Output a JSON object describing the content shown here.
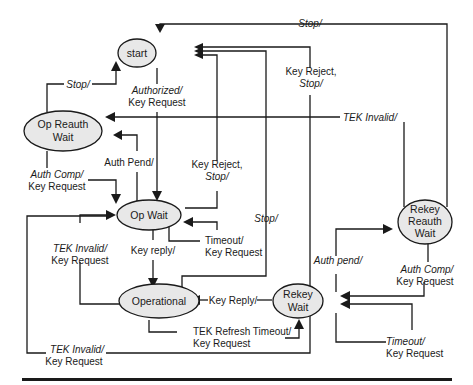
{
  "diagram": {
    "type": "state-machine",
    "states": [
      {
        "id": "start",
        "label": [
          "start"
        ]
      },
      {
        "id": "op_reauth_wait",
        "label": [
          "Op Reauth",
          "Wait"
        ]
      },
      {
        "id": "op_wait",
        "label": [
          "Op Wait"
        ]
      },
      {
        "id": "operational",
        "label": [
          "Operational"
        ]
      },
      {
        "id": "rekey_wait",
        "label": [
          "Rekey",
          "Wait"
        ]
      },
      {
        "id": "rekey_reauth_wait",
        "label": [
          "Rekey",
          "Reauth",
          "Wait"
        ]
      }
    ],
    "transitions": [
      {
        "from": "op_reauth_wait",
        "to": "start",
        "event": "Stop/",
        "action": ""
      },
      {
        "from": "start",
        "to": "op_wait",
        "event": "Authorized/",
        "action": "Key Request"
      },
      {
        "from": "op_wait",
        "to": "op_reauth_wait",
        "event": "Auth Pend/",
        "action": ""
      },
      {
        "from": "op_reauth_wait",
        "to": "op_wait",
        "event": "Auth Comp/",
        "action": "Key Request"
      },
      {
        "from": "op_wait",
        "to": "start",
        "event": "Key Reject, Stop/",
        "action": ""
      },
      {
        "from": "op_wait",
        "to": "op_wait",
        "event": "Timeout/",
        "action": "Key Request"
      },
      {
        "from": "op_wait",
        "to": "operational",
        "event": "Key reply/",
        "action": ""
      },
      {
        "from": "operational",
        "to": "op_wait",
        "event": "TEK Invalid/",
        "action": "Key Request"
      },
      {
        "from": "operational",
        "to": "start",
        "event": "Stop/",
        "action": ""
      },
      {
        "from": "operational",
        "to": "rekey_wait",
        "event": "TEK Refresh Timeout/",
        "action": "Key Request"
      },
      {
        "from": "rekey_wait",
        "to": "operational",
        "event": "Key Reply/",
        "action": ""
      },
      {
        "from": "rekey_wait",
        "to": "start",
        "event": "Key Reject, Stop/",
        "action": ""
      },
      {
        "from": "rekey_wait",
        "to": "op_wait",
        "event": "TEK Invalid/",
        "action": "Key Request"
      },
      {
        "from": "rekey_wait",
        "to": "rekey_reauth_wait",
        "event": "Auth pend/",
        "action": ""
      },
      {
        "from": "rekey_reauth_wait",
        "to": "rekey_wait",
        "event": "Auth Comp/",
        "action": "Key Request"
      },
      {
        "from": "rekey_wait",
        "to": "rekey_wait",
        "event": "Timeout/",
        "action": "Key Request"
      },
      {
        "from": "rekey_reauth_wait",
        "to": "op_reauth_wait",
        "event": "TEK Invalid/",
        "action": ""
      },
      {
        "from": "rekey_reauth_wait",
        "to": "start",
        "event": "Stop/",
        "action": ""
      }
    ]
  },
  "labels": {
    "stop_reauth": "Stop/",
    "authorized": "Authorized/",
    "authorized_action": "Key Request",
    "auth_pend": "Auth Pend/",
    "auth_comp": "Auth Comp/",
    "auth_comp_action": "Key Request",
    "key_reject_opwait_1": "Key Reject,",
    "key_reject_opwait_2": "Stop/",
    "timeout_opwait": "Timeout/",
    "timeout_opwait_action": "Key Request",
    "key_reply_lower": "Key reply/",
    "tek_invalid_op": "TEK Invalid/",
    "tek_invalid_op_action": "Key Request",
    "stop_operational": "Stop/",
    "tek_refresh": "TEK Refresh Timeout/",
    "tek_refresh_action": "Key Request",
    "key_reply_upper": "Key Reply/",
    "key_reject_rekey_1": "Key Reject,",
    "key_reject_rekey_2": "Stop/",
    "tek_invalid_rekey": "TEK Invalid/",
    "tek_invalid_rekey_action": "Key Request",
    "auth_pend_rekey": "Auth pend/",
    "auth_comp_rekey": "Auth Comp/",
    "auth_comp_rekey_action": "Key Request",
    "timeout_rekey": "Timeout/",
    "timeout_rekey_action": "Key Request",
    "tek_invalid_top": "TEK Invalid/",
    "stop_top": "Stop/"
  }
}
